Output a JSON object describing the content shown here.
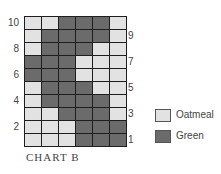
{
  "chart_data": {
    "type": "heatmap",
    "title": "CHART B",
    "columns": 6,
    "rows": 10,
    "row_order": "top-to-bottom = row 10 to row 1",
    "legend": [
      {
        "key": "L",
        "label": "Oatmeal",
        "color": "#e2e2e2"
      },
      {
        "key": "G",
        "label": "Green",
        "color": "#6b6b6b"
      }
    ],
    "grid": [
      {
        "row": 10,
        "cells": [
          "L",
          "L",
          "G",
          "G",
          "G",
          "L"
        ]
      },
      {
        "row": 9,
        "cells": [
          "L",
          "G",
          "G",
          "G",
          "G",
          "L"
        ]
      },
      {
        "row": 8,
        "cells": [
          "L",
          "G",
          "G",
          "G",
          "L",
          "L"
        ]
      },
      {
        "row": 7,
        "cells": [
          "G",
          "G",
          "G",
          "L",
          "L",
          "L"
        ]
      },
      {
        "row": 6,
        "cells": [
          "G",
          "G",
          "G",
          "L",
          "L",
          "L"
        ]
      },
      {
        "row": 5,
        "cells": [
          "L",
          "G",
          "G",
          "G",
          "L",
          "L"
        ]
      },
      {
        "row": 4,
        "cells": [
          "L",
          "G",
          "G",
          "G",
          "G",
          "L"
        ]
      },
      {
        "row": 3,
        "cells": [
          "L",
          "L",
          "G",
          "G",
          "G",
          "L"
        ]
      },
      {
        "row": 2,
        "cells": [
          "L",
          "L",
          "L",
          "G",
          "G",
          "G"
        ]
      },
      {
        "row": 1,
        "cells": [
          "L",
          "L",
          "L",
          "G",
          "G",
          "G"
        ]
      }
    ],
    "left_row_labels": [
      "10",
      "8",
      "6",
      "4",
      "2"
    ],
    "right_row_labels": [
      "9",
      "7",
      "5",
      "3",
      "1"
    ]
  },
  "caption": "CHART B",
  "legend": {
    "oatmeal": "Oatmeal",
    "green": "Green"
  }
}
